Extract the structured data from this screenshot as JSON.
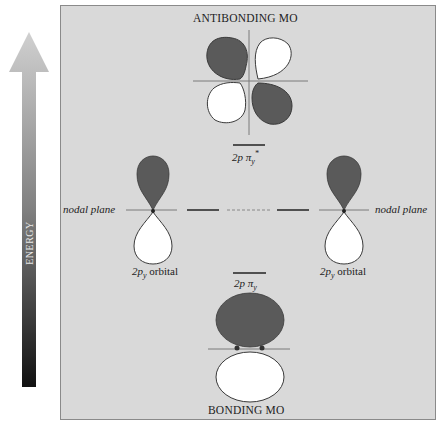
{
  "energy_axis": {
    "label": "ENERGY",
    "direction": "up"
  },
  "titles": {
    "top": "ANTIBONDING MO",
    "bottom": "BONDING MO"
  },
  "levels": {
    "antibonding": {
      "label_main": "2p π",
      "label_sub": "y",
      "label_sup": "*"
    },
    "bonding": {
      "label_main": "2p π",
      "label_sub": "y"
    }
  },
  "atomic_orbitals": [
    {
      "label_main": "2p",
      "label_sub": "y",
      "label_rest": " orbital",
      "side": "left"
    },
    {
      "label_main": "2p",
      "label_sub": "y",
      "label_rest": " orbital",
      "side": "right"
    }
  ],
  "nodal_plane_left": "nodal plane",
  "nodal_plane_right": "nodal plane",
  "colors": {
    "shaded_lobe": "#5a5a5a",
    "unshaded_lobe": "#ffffff",
    "background": "#d9d9d9",
    "axis_line": "#7a7a7a"
  }
}
